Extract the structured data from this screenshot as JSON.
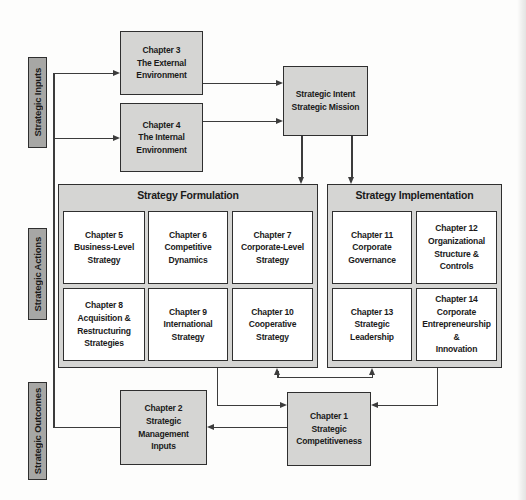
{
  "figure": {
    "type": "flow-diagram"
  },
  "side_labels": {
    "inputs": "Strategic Inputs",
    "actions": "Strategic Actions",
    "outcomes": "Strategic Outcomes"
  },
  "sections": {
    "formulation": {
      "title": "Strategy Formulation"
    },
    "implementation": {
      "title": "Strategy Implementation"
    }
  },
  "boxes": {
    "ch3": {
      "label": "Chapter 3\nThe External\nEnvironment"
    },
    "ch4": {
      "label": "Chapter 4\nThe Internal\nEnvironment"
    },
    "intent": {
      "label": "Strategic Intent\nStrategic Mission"
    },
    "ch5": {
      "label": "Chapter 5\nBusiness-Level\nStrategy"
    },
    "ch6": {
      "label": "Chapter 6\nCompetitive\nDynamics"
    },
    "ch7": {
      "label": "Chapter 7\nCorporate-Level\nStrategy"
    },
    "ch8": {
      "label": "Chapter 8\nAcquisition &\nRestructuring\nStrategies"
    },
    "ch9": {
      "label": "Chapter 9\nInternational\nStrategy"
    },
    "ch10": {
      "label": "Chapter 10\nCooperative\nStrategy"
    },
    "ch11": {
      "label": "Chapter 11\nCorporate\nGovernance"
    },
    "ch12": {
      "label": "Chapter 12\nOrganizational\nStructure &\nControls"
    },
    "ch13": {
      "label": "Chapter 13\nStrategic\nLeadership"
    },
    "ch14": {
      "label": "Chapter 14\nCorporate\nEntrepreneurship &\nInnovation"
    },
    "ch2": {
      "label": "Chapter 2\nStrategic\nManagement\nInputs"
    },
    "ch1": {
      "label": "Chapter 1\nStrategic\nCompetitiveness"
    }
  },
  "colors": {
    "box_fill": "#d5d5d3",
    "side_label_fill": "#a7a7a5",
    "inner_box_fill": "#ffffff",
    "line": "#3c3c3c",
    "text": "#1a1a1a",
    "border": "#2f2f2f"
  }
}
